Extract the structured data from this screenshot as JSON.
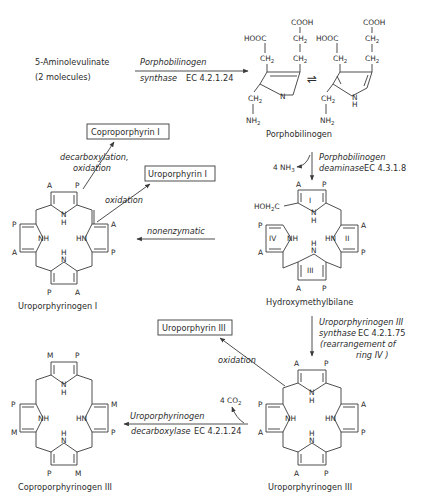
{
  "diagram": {
    "substrate": {
      "line1": "5-Aminolevulinate",
      "line2": "(2 molecules)"
    },
    "porphobilinogen": {
      "label": "Porphobilinogen",
      "groups": {
        "cooh": "COOH",
        "hooc": "HOOC",
        "ch2": "CH",
        "sub2": "2",
        "nh2": "NH",
        "n": "N",
        "nh_n": "N",
        "nh_h": "H"
      },
      "equilibrium_symbol": "⇌"
    },
    "steps": [
      {
        "id": "pbg-synthase",
        "enzyme_line1": "Porphobilinogen",
        "enzyme_line2": "synthase",
        "ec": "EC 4.2.1.24"
      },
      {
        "id": "pbg-deaminase",
        "enzyme_line1": "Porphobilinogen",
        "enzyme_line2": "deaminase",
        "ec": "EC 4.3.1.8",
        "byproduct": "4 NH",
        "byproduct_sub": "3"
      },
      {
        "id": "nonenzymatic",
        "label": "nonenzymatic"
      },
      {
        "id": "uro-iii-synthase",
        "enzyme_line1": "Uroporphyrinogen III",
        "enzyme_line2": "synthase",
        "ec": "EC 4.2.1.75",
        "note_line1": "(rearrangement of",
        "note_line2": "ring IV )"
      },
      {
        "id": "uro-decarboxylase",
        "enzyme_line1": "Uroporphyrinogen",
        "enzyme_line2": "decarboxylase",
        "ec": "EC 4.2.1.24",
        "byproduct": "4 CO",
        "byproduct_sub": "2"
      }
    ],
    "side_reactions": {
      "decarb_oxidation_line1": "decarboxylation,",
      "decarb_oxidation_line2": "oxidation",
      "oxidation_1": "oxidation",
      "oxidation_2": "oxidation"
    },
    "boxed_products": {
      "coproporphyrin_i": "Coproporphyrin I",
      "uroporphyrin_i": "Uroporphyrin I",
      "uroporphyrin_iii": "Uroporphyrin III"
    },
    "molecules": {
      "uroporphyrinogen_i": {
        "label": "Uroporphyrinogen I",
        "substituents": [
          "A",
          "P",
          "A",
          "P",
          "A",
          "P",
          "A",
          "P"
        ]
      },
      "hydroxymethylbilane": {
        "label": "Hydroxymethylbilane",
        "hoh2c": "HOH",
        "hoh2c_sub": "2",
        "hoh2c_c": "C",
        "rings": [
          "I",
          "II",
          "III",
          "IV"
        ],
        "substituents": [
          "A",
          "P",
          "A",
          "P",
          "A",
          "P",
          "A",
          "P"
        ]
      },
      "uroporphyrinogen_iii": {
        "label": "Uroporphyrinogen III",
        "substituents": [
          "A",
          "P",
          "A",
          "P",
          "A",
          "P",
          "A",
          "P"
        ]
      },
      "coproporphyrinogen_iii": {
        "label": "Coproporphyrinogen III",
        "substituents": [
          "M",
          "P",
          "M",
          "P",
          "M",
          "P",
          "M",
          "P"
        ]
      }
    },
    "ring_atoms": {
      "nh": "NH",
      "hn": "HN",
      "n": "N",
      "h": "H"
    },
    "colors": {
      "ink": "#2b2b2b",
      "background": "#ffffff"
    }
  }
}
